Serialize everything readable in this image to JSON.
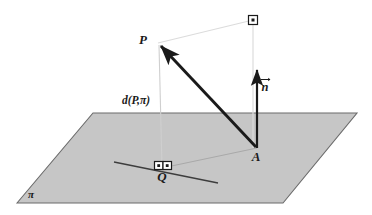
{
  "figure": {
    "background_color": "#ffffff"
  },
  "labels": {
    "point_p": "P",
    "point_a": "A",
    "point_q": "Q",
    "distance": "d(P,π)",
    "normal_vector": "n",
    "plane": "π"
  },
  "colors": {
    "plane_fill": "#c6c6c6",
    "plane_stroke": "#6b6b6b",
    "main_arrow": "#1a1a1a",
    "normal_arrow": "#1a1a1a",
    "guide_line": "#d6d6d6",
    "thin_line": "#8a8a8a",
    "label": "#1a1a1a",
    "marker_stroke": "#1a1a1a"
  },
  "geometry": {
    "plane_polygon": [
      [
        17,
        203
      ],
      [
        93,
        113
      ],
      [
        357,
        113
      ],
      [
        283,
        203
      ]
    ],
    "point_p": [
      158,
      43
    ],
    "point_a": [
      257,
      148
    ],
    "point_q": [
      162,
      168
    ],
    "normal_tip": [
      257,
      67
    ],
    "corner_marker_top": [
      253,
      20
    ],
    "line_in_plane_start": [
      114,
      162
    ],
    "line_in_plane_end": [
      218,
      183
    ]
  },
  "markers": {
    "right_angle_top": "right-angle-square-with-dot",
    "right_angle_q_left": "right-angle-square-with-dot",
    "right_angle_q_right": "right-angle-square-with-dot"
  }
}
